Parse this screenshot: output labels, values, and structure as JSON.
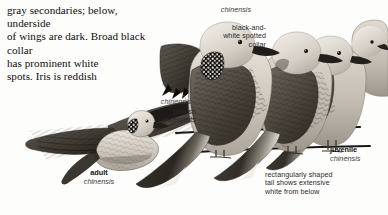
{
  "plate": {
    "width": 388,
    "height": 215,
    "background": "#fdfdfb",
    "subject": "Oriental Turtle-Dove",
    "description_text": "gray secondaries; below, underside\nof wings are dark. Broad black collar\nhas prominent white\nspots. Iris is reddish"
  },
  "callouts": {
    "wing_detail_species": "chinensis",
    "pinkish_underparts": "pinkish\nunderparts",
    "upper_species": "chinensis",
    "spotted_collar": "black-and-\nwhite spotted\ncollar",
    "tail_note": "rectangularly shaped\ntail shows extensive\nwhite from below"
  },
  "labels": {
    "adult": {
      "name": "adult",
      "species": "chinensis"
    },
    "juvenile": {
      "name": "juvenile",
      "species": "chinensis"
    }
  },
  "colors": {
    "ink": "#0d0d0d",
    "callout_gray": "#2a2a2a",
    "species_gray": "#3a3a3a",
    "paper": "#fdfdfb",
    "plumage_dark": "#3b3631",
    "plumage_mid": "#8b857c",
    "plumage_light": "#c9c3ba",
    "plumage_pale": "#e2ddd4",
    "collar_black": "#141210",
    "bill_dark": "#2a2724",
    "branch": "#1a1714"
  },
  "figures": [
    {
      "id": "adult-flying-dove",
      "pose": "in flight, left profile, wings spread",
      "label": "adult chinensis"
    },
    {
      "id": "wing-detail-sketch",
      "pose": "folded wing / scapular detail",
      "label": "chinensis"
    },
    {
      "id": "perched-dove-front",
      "pose": "perched, facing right, spotted collar",
      "label": "chinensis"
    },
    {
      "id": "perched-dove-middle",
      "pose": "perched, facing right",
      "label": "chinensis"
    },
    {
      "id": "perched-dove-juvenile",
      "pose": "perched, facing right, plain collar",
      "label": "juvenile chinensis"
    },
    {
      "id": "perched-dove-rear-edge",
      "pose": "partial head at right edge",
      "label": ""
    }
  ]
}
